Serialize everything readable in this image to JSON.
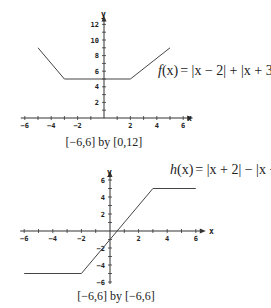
{
  "chart_data": [
    {
      "type": "line",
      "title": "f(x) = |x - 2| + |x + 3|",
      "function_label": "f(x) = |x − 2| + |x + 3|",
      "window_caption": "[−6,6] by [0,12]",
      "xlabel": "x",
      "ylabel": "y",
      "xlim": [
        -6,
        6
      ],
      "ylim": [
        0,
        12
      ],
      "x_ticks": [
        -6,
        -4,
        -2,
        2,
        4,
        6
      ],
      "y_ticks": [
        2,
        4,
        6,
        8,
        10,
        12
      ],
      "x_tick_labels": [
        "−6",
        "−4",
        "−2",
        "2",
        "4",
        "6"
      ],
      "y_tick_labels": [
        "2",
        "4",
        "6",
        "8",
        "10",
        "12"
      ],
      "grid": false,
      "series": [
        {
          "name": "f(x)",
          "x": [
            -5,
            -3,
            2,
            5
          ],
          "y": [
            9,
            5,
            5,
            9
          ]
        }
      ]
    },
    {
      "type": "line",
      "title": "h(x) = |x + 2| - |x - 3|",
      "function_label": "h(x) = |x + 2| − |x − 3|",
      "window_caption": "[−6,6] by [−6,6]",
      "xlabel": "x",
      "ylabel": "y",
      "xlim": [
        -6,
        6
      ],
      "ylim": [
        -6,
        6
      ],
      "x_ticks": [
        -6,
        -4,
        -2,
        2,
        4,
        6
      ],
      "y_ticks": [
        -6,
        -4,
        -2,
        2,
        4,
        6
      ],
      "x_tick_labels": [
        "−6",
        "−4",
        "−2",
        "2",
        "4",
        "6"
      ],
      "y_tick_labels": [
        "−6",
        "−4",
        "−2",
        "2",
        "4",
        "6"
      ],
      "grid": false,
      "series": [
        {
          "name": "h(x)",
          "x": [
            -6,
            -2,
            3,
            6
          ],
          "y": [
            -5,
            -5,
            5,
            5
          ]
        }
      ]
    }
  ],
  "graph1": {
    "axis_x": "x",
    "axis_y": "y",
    "caption": "[−6,6] by [0,12]",
    "formula": {
      "name": "f",
      "arg": "(x)",
      "rhs": "= |x − 2| + |x + 3|"
    }
  },
  "graph2": {
    "axis_x": "x",
    "axis_y": "y",
    "caption": "[−6,6] by [−6,6]",
    "formula": {
      "name": "h",
      "arg": "(x)",
      "rhs": "= |x + 2| − |x − 3|"
    }
  }
}
